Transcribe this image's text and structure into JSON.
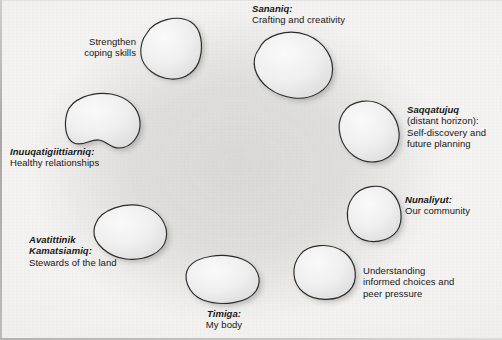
{
  "diagram": {
    "background_color": "#f4f3f1",
    "backdrop_color": "#9a9a9a",
    "stone_fill_color": "#ededed",
    "stone_outline_color": "#2a2a2a",
    "stone_count": 8
  },
  "nodes": [
    {
      "id": "strengthen-coping-skills",
      "term": "",
      "lines": [
        "Strengthen",
        "coping skills"
      ],
      "align": "right",
      "stone_index": 0
    },
    {
      "id": "sananiq",
      "term": "Sananiq:",
      "lines": [
        "Crafting and creativity"
      ],
      "align": "left",
      "stone_index": 1
    },
    {
      "id": "saqqatujuq",
      "term": "Saqqatujuq",
      "lines": [
        "(distant horizon):",
        "Self-discovery and",
        "future planning"
      ],
      "align": "left",
      "stone_index": 2
    },
    {
      "id": "nunaliyut",
      "term": "Nunaliyut:",
      "lines": [
        "Our community"
      ],
      "align": "left",
      "stone_index": 3
    },
    {
      "id": "understanding-informed-choices",
      "term": "",
      "lines": [
        "Understanding",
        "informed choices and",
        "peer pressure"
      ],
      "align": "left",
      "stone_index": 4
    },
    {
      "id": "timiga",
      "term": "Timiga:",
      "lines": [
        "My body"
      ],
      "align": "center",
      "stone_index": 5
    },
    {
      "id": "avatittinik-kamatsiamiq",
      "term": "Avatittinik\nKamatsiamiq:",
      "term_lines": [
        "Avatittinik",
        "Kamatsiamiq:"
      ],
      "lines": [
        "Stewards of the land"
      ],
      "align": "left",
      "stone_index": 6
    },
    {
      "id": "inuuqatigiittiarniq",
      "term": "Inuuqatigiittiarniq:",
      "lines": [
        "Healthy relationships"
      ],
      "align": "left",
      "stone_index": 7
    }
  ],
  "text": {
    "strengthen_line1": "Strengthen",
    "strengthen_line2": "coping skills",
    "sananiq_term": "Sananiq:",
    "sananiq_desc": "Crafting and creativity",
    "saqqatujuq_term": "Saqqatujuq",
    "saqqatujuq_line1": "(distant horizon):",
    "saqqatujuq_line2": "Self-discovery and",
    "saqqatujuq_line3": "future planning",
    "nunaliyut_term": "Nunaliyut:",
    "nunaliyut_desc": "Our community",
    "understanding_line1": "Understanding",
    "understanding_line2": "informed choices and",
    "understanding_line3": "peer pressure",
    "timiga_term": "Timiga:",
    "timiga_desc": "My body",
    "avatittinik_term1": "Avatittinik",
    "avatittinik_term2": "Kamatsiamiq:",
    "avatittinik_desc": "Stewards of the land",
    "inuuqatigiittiarniq_term": "Inuuqatigiittiarniq:",
    "inuuqatigiittiarniq_desc": "Healthy relationships"
  }
}
